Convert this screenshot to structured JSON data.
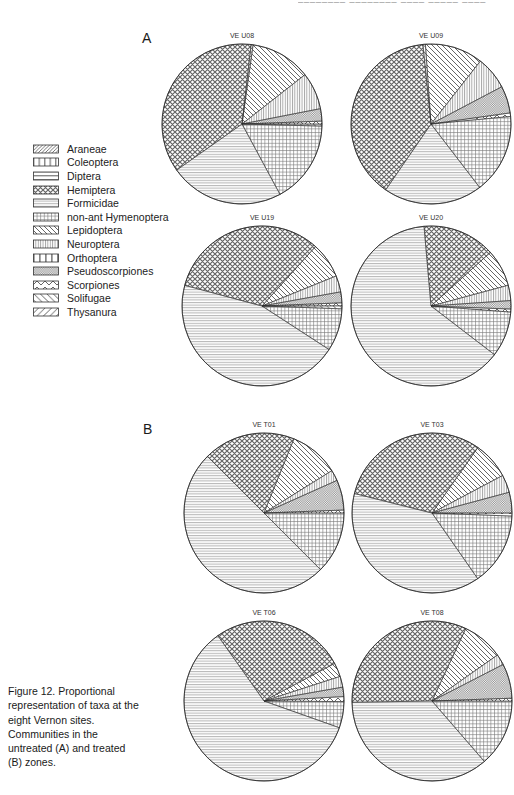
{
  "page": {
    "running_head_clipped": "________ ________  ____ _____      ____",
    "group_a_label": "A",
    "group_b_label": "B"
  },
  "caption": {
    "text": "Figure 12. Proportional representation of taxa at the eight Vernon sites. Communities in the untreated (A) and treated (B) zones."
  },
  "legend": {
    "items": [
      {
        "label": "Araneae",
        "key": "araneae"
      },
      {
        "label": "Coleoptera",
        "key": "coleoptera"
      },
      {
        "label": "Diptera",
        "key": "diptera"
      },
      {
        "label": "Hemiptera",
        "key": "hemiptera"
      },
      {
        "label": "Formicidae",
        "key": "formicidae"
      },
      {
        "label": "non-ant Hymenoptera",
        "key": "nonant"
      },
      {
        "label": "Lepidoptera",
        "key": "lepidoptera"
      },
      {
        "label": "Neuroptera",
        "key": "neuroptera"
      },
      {
        "label": "Orthoptera",
        "key": "orthoptera"
      },
      {
        "label": "Pseudoscorpiones",
        "key": "pseudoscorpiones"
      },
      {
        "label": "Scorpiones",
        "key": "scorpiones"
      },
      {
        "label": "Solifugae",
        "key": "solifugae"
      },
      {
        "label": "Thysanura",
        "key": "thysanura"
      }
    ]
  },
  "chart_data": {
    "type": "pie",
    "values_unit": "percent_estimated_from_slice_angles",
    "pies": [
      {
        "title": "VE U08",
        "group": "A",
        "start_angle_deg": 8,
        "slices": [
          {
            "taxon": "Lepidoptera",
            "key": "lepidoptera",
            "value": 12.2
          },
          {
            "taxon": "Neuroptera",
            "key": "neuroptera",
            "value": 7.5
          },
          {
            "taxon": "Pseudoscorpiones",
            "key": "pseudoscorpiones",
            "value": 2.5
          },
          {
            "taxon": "Scorpiones",
            "key": "scorpiones",
            "value": 0.6
          },
          {
            "taxon": "Solifugae",
            "key": "solifugae",
            "value": 0.4
          },
          {
            "taxon": "non-ant Hymenoptera",
            "key": "nonant",
            "value": 16.7
          },
          {
            "taxon": "Formicidae",
            "key": "formicidae",
            "value": 23.1
          },
          {
            "taxon": "Hemiptera",
            "key": "hemiptera",
            "value": 36.6
          },
          {
            "taxon": "Araneae",
            "key": "araneae",
            "value": 0.4
          }
        ]
      },
      {
        "title": "VE U09",
        "group": "A",
        "start_angle_deg": -4,
        "slices": [
          {
            "taxon": "Lepidoptera",
            "key": "lepidoptera",
            "value": 11.7
          },
          {
            "taxon": "Neuroptera",
            "key": "neuroptera",
            "value": 6.7
          },
          {
            "taxon": "Pseudoscorpiones",
            "key": "pseudoscorpiones",
            "value": 5.5
          },
          {
            "taxon": "Scorpiones",
            "key": "scorpiones",
            "value": 0.7
          },
          {
            "taxon": "non-ant Hymenoptera",
            "key": "nonant",
            "value": 16.1
          },
          {
            "taxon": "Formicidae",
            "key": "formicidae",
            "value": 20.0
          },
          {
            "taxon": "Hemiptera",
            "key": "hemiptera",
            "value": 38.8
          },
          {
            "taxon": "Solifugae",
            "key": "solifugae",
            "value": 0.5
          }
        ]
      },
      {
        "title": "VE U19",
        "group": "A",
        "start_angle_deg": 42,
        "slices": [
          {
            "taxon": "Lepidoptera",
            "key": "lepidoptera",
            "value": 7.2
          },
          {
            "taxon": "Neuroptera",
            "key": "neuroptera",
            "value": 3.3
          },
          {
            "taxon": "Pseudoscorpiones",
            "key": "pseudoscorpiones",
            "value": 2.2
          },
          {
            "taxon": "Scorpiones",
            "key": "scorpiones",
            "value": 0.6
          },
          {
            "taxon": "Solifugae",
            "key": "solifugae",
            "value": 0.6
          },
          {
            "taxon": "non-ant Hymenoptera",
            "key": "nonant",
            "value": 8.6
          },
          {
            "taxon": "Formicidae",
            "key": "formicidae",
            "value": 45.0
          },
          {
            "taxon": "Hemiptera",
            "key": "hemiptera",
            "value": 32.5
          }
        ]
      },
      {
        "title": "VE U20",
        "group": "A",
        "start_angle_deg": 355,
        "slices": [
          {
            "taxon": "Hemiptera",
            "key": "hemiptera",
            "value": 14.7
          },
          {
            "taxon": "Lepidoptera",
            "key": "lepidoptera",
            "value": 7.5
          },
          {
            "taxon": "Neuroptera",
            "key": "neuroptera",
            "value": 3.1
          },
          {
            "taxon": "Pseudoscorpiones",
            "key": "pseudoscorpiones",
            "value": 1.7
          },
          {
            "taxon": "Scorpiones",
            "key": "scorpiones",
            "value": 0.6
          },
          {
            "taxon": "non-ant Hymenoptera",
            "key": "nonant",
            "value": 9.2
          },
          {
            "taxon": "Formicidae",
            "key": "formicidae",
            "value": 63.2
          }
        ]
      },
      {
        "title": "VE T01",
        "group": "B",
        "start_angle_deg": 22,
        "slices": [
          {
            "taxon": "Lepidoptera",
            "key": "lepidoptera",
            "value": 10.0
          },
          {
            "taxon": "Neuroptera",
            "key": "neuroptera",
            "value": 2.2
          },
          {
            "taxon": "Pseudoscorpiones",
            "key": "pseudoscorpiones",
            "value": 6.1
          },
          {
            "taxon": "Scorpiones",
            "key": "scorpiones",
            "value": 0.6
          },
          {
            "taxon": "non-ant Hymenoptera",
            "key": "nonant",
            "value": 12.5
          },
          {
            "taxon": "Formicidae",
            "key": "formicidae",
            "value": 50.0
          },
          {
            "taxon": "Hemiptera",
            "key": "hemiptera",
            "value": 18.6
          }
        ]
      },
      {
        "title": "VE T03",
        "group": "B",
        "start_angle_deg": 35,
        "slices": [
          {
            "taxon": "Lepidoptera",
            "key": "lepidoptera",
            "value": 7.5
          },
          {
            "taxon": "Neuroptera",
            "key": "neuroptera",
            "value": 3.6
          },
          {
            "taxon": "Pseudoscorpiones",
            "key": "pseudoscorpiones",
            "value": 4.2
          },
          {
            "taxon": "Scorpiones",
            "key": "scorpiones",
            "value": 0.6
          },
          {
            "taxon": "non-ant Hymenoptera",
            "key": "nonant",
            "value": 14.7
          },
          {
            "taxon": "Formicidae",
            "key": "formicidae",
            "value": 38.6
          },
          {
            "taxon": "Hemiptera",
            "key": "hemiptera",
            "value": 30.8
          }
        ]
      },
      {
        "title": "VE T06",
        "group": "B",
        "start_angle_deg": 62,
        "slices": [
          {
            "taxon": "Lepidoptera",
            "key": "lepidoptera",
            "value": 2.8
          },
          {
            "taxon": "Neuroptera",
            "key": "neuroptera",
            "value": 2.2
          },
          {
            "taxon": "Pseudoscorpiones",
            "key": "pseudoscorpiones",
            "value": 1.9
          },
          {
            "taxon": "Scorpiones",
            "key": "scorpiones",
            "value": 1.0
          },
          {
            "taxon": "non-ant Hymenoptera",
            "key": "nonant",
            "value": 5.3
          },
          {
            "taxon": "Formicidae",
            "key": "formicidae",
            "value": 59.8
          },
          {
            "taxon": "Hemiptera",
            "key": "hemiptera",
            "value": 27.0
          }
        ]
      },
      {
        "title": "VE T08",
        "group": "B",
        "start_angle_deg": 25,
        "slices": [
          {
            "taxon": "Lepidoptera",
            "key": "lepidoptera",
            "value": 8.3
          },
          {
            "taxon": "Neuroptera",
            "key": "neuroptera",
            "value": 2.2
          },
          {
            "taxon": "Pseudoscorpiones",
            "key": "pseudoscorpiones",
            "value": 7.0
          },
          {
            "taxon": "Scorpiones",
            "key": "scorpiones",
            "value": 0.6
          },
          {
            "taxon": "non-ant Hymenoptera",
            "key": "nonant",
            "value": 13.6
          },
          {
            "taxon": "Formicidae",
            "key": "formicidae",
            "value": 36.1
          },
          {
            "taxon": "Hemiptera",
            "key": "hemiptera",
            "value": 32.2
          }
        ]
      }
    ]
  },
  "colors": {
    "ink": "#1a1a1a",
    "hatch_dark": "#444444",
    "hatch_mid": "#666666",
    "hatch_light": "#8a8a8a",
    "paper": "#ffffff"
  }
}
